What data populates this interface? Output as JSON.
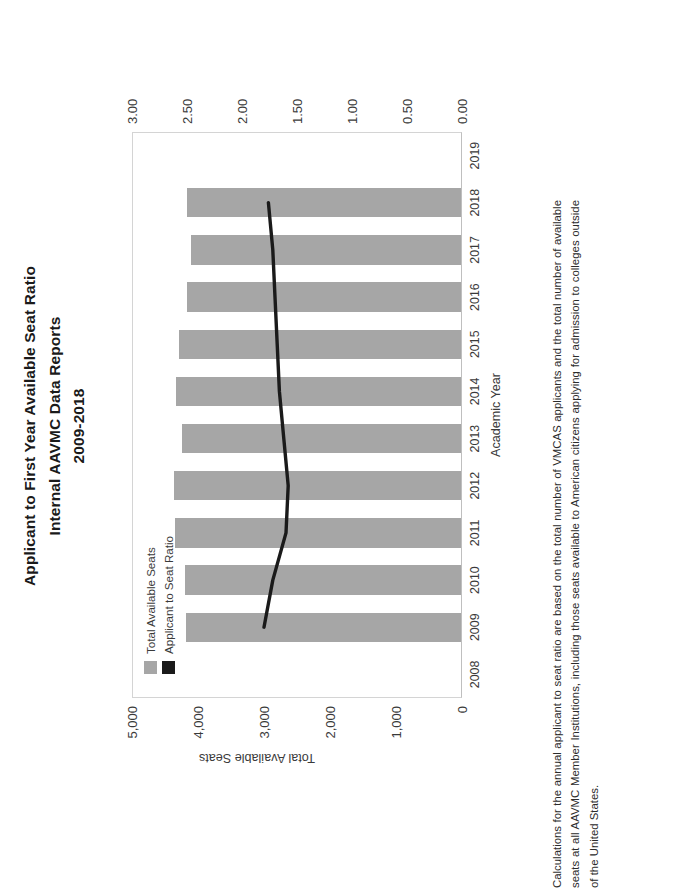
{
  "document": {
    "title_lines": [
      "Applicant to First Year Available Seat Ratio",
      "Internal AAVMC Data Reports",
      "2009-2018"
    ],
    "caption": "Calculations for the annual applicant to seat ratio are based on the total number of VMCAS applicants and the total number of available seats at all AAVMC Member Institutions, including those seats available to American citizens applying for admission to colleges outside of the United States."
  },
  "legend": {
    "items": [
      {
        "label": "Total Available Seats",
        "color": "#a6a6a6"
      },
      {
        "label": "Applicant to Seat Ratio",
        "color": "#1a1a1a"
      }
    ]
  },
  "axes": {
    "left": {
      "title": "Total Available Seats",
      "ticks": [
        "5,000",
        "4,000",
        "3,000",
        "2,000",
        "1,000",
        "0"
      ],
      "min": 0,
      "max": 5000
    },
    "right": {
      "title": "Applicant to Seat Ratio",
      "ticks": [
        "3.00",
        "2.50",
        "2.00",
        "1.50",
        "1.00",
        "0.50",
        "0.00"
      ],
      "min": 0,
      "max": 3.0
    },
    "bottom": {
      "title": "Academic Year",
      "ticks": [
        "2008",
        "2009",
        "2010",
        "2011",
        "2012",
        "2013",
        "2014",
        "2015",
        "2016",
        "2017",
        "2018",
        "2019"
      ]
    }
  },
  "chart_data": {
    "type": "bar",
    "title": "Applicant to First Year Available Seat Ratio",
    "subtitle": "Internal AAVMC Data Reports 2009-2018",
    "xlabel": "Academic Year",
    "ylabel": "Total Available Seats",
    "y2label": "Applicant to Seat Ratio",
    "categories": [
      "2009",
      "2010",
      "2011",
      "2012",
      "2013",
      "2014",
      "2015",
      "2016",
      "2017",
      "2018"
    ],
    "ylim": [
      0,
      5000
    ],
    "y2lim": [
      0,
      3.0
    ],
    "grid": false,
    "legend_position": "inside-top-left",
    "orientation": "rotated-90-clockwise",
    "series": [
      {
        "name": "Total Available Seats",
        "type": "bar",
        "axis": "left",
        "color": "#a6a6a6",
        "values": [
          4180,
          4190,
          4350,
          4360,
          4250,
          4330,
          4290,
          4160,
          4100,
          4160
        ]
      },
      {
        "name": "Applicant to Seat Ratio",
        "type": "line",
        "axis": "right",
        "color": "#1a1a1a",
        "values": [
          1.8,
          1.72,
          1.6,
          1.58,
          1.62,
          1.66,
          1.68,
          1.7,
          1.72,
          1.76
        ]
      }
    ]
  }
}
